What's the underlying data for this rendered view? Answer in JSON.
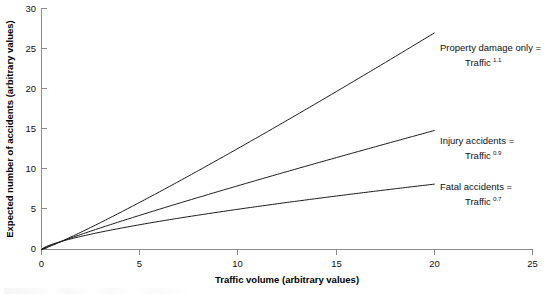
{
  "chart_data": {
    "type": "line",
    "title": "",
    "xlabel": "Traffic volume (arbitrary values)",
    "ylabel": "Expected number of accidents (arbitrary values)",
    "xlim": [
      0,
      25
    ],
    "ylim": [
      0,
      30
    ],
    "xticks": [
      "0",
      "5",
      "10",
      "15",
      "20",
      "25"
    ],
    "yticks": [
      "0",
      "5",
      "10",
      "15",
      "20",
      "25",
      "30"
    ],
    "grid": false,
    "legend_position": "inline-right-annotations",
    "series": [
      {
        "name": "Property damage only",
        "formula": "Traffic",
        "exponent": "1.1",
        "x": [
          0,
          2,
          4,
          6,
          8,
          10,
          12,
          14,
          16,
          18,
          20
        ],
        "values": [
          0,
          2.14,
          4.59,
          7.18,
          9.85,
          12.59,
          15.38,
          18.21,
          21.08,
          23.98,
          26.91
        ]
      },
      {
        "name": "Injury accidents",
        "formula": "Traffic",
        "exponent": "0.9",
        "x": [
          0,
          2,
          4,
          6,
          8,
          10,
          12,
          14,
          16,
          18,
          20
        ],
        "values": [
          0,
          1.87,
          3.48,
          5.0,
          6.5,
          7.94,
          9.35,
          10.73,
          12.09,
          13.43,
          14.76
        ]
      },
      {
        "name": "Fatal accidents",
        "formula": "Traffic",
        "exponent": "0.7",
        "x": [
          0,
          2,
          4,
          6,
          8,
          10,
          12,
          14,
          16,
          18,
          20
        ],
        "values": [
          0,
          1.62,
          2.64,
          3.51,
          4.29,
          5.01,
          5.7,
          6.35,
          6.98,
          7.58,
          8.14
        ]
      }
    ],
    "annotations": [
      {
        "id": "property-damage",
        "line1": "Property damage only =",
        "line2_base": "Traffic",
        "line2_exp": "1.1"
      },
      {
        "id": "injury-accidents",
        "line1": "Injury accidents =",
        "line2_base": "Traffic",
        "line2_exp": "0.9"
      },
      {
        "id": "fatal-accidents",
        "line1": "Fatal accidents =",
        "line2_base": "Traffic",
        "line2_exp": "0.7"
      }
    ]
  },
  "colors": {
    "curve": "#1a1a1a",
    "axis": "#8c8c8c",
    "text": "#111111",
    "background": "#ffffff"
  }
}
